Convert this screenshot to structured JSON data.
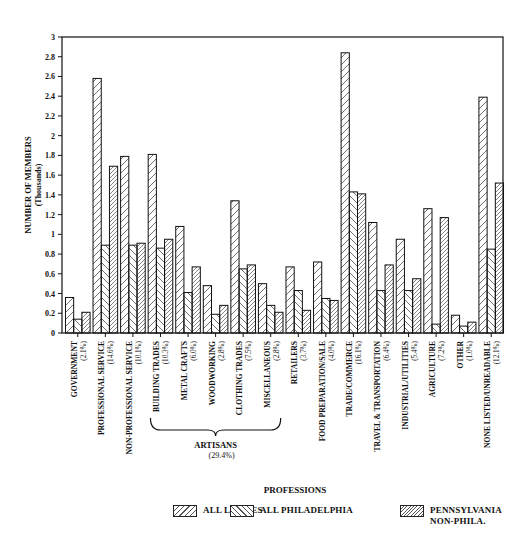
{
  "chart_data": {
    "type": "bar",
    "title": "",
    "xlabel": "PROFESSIONS",
    "ylabel": "NUMBER OF MEMBERS",
    "ylabel_sub": "(Thousands)",
    "ylim": [
      0,
      3
    ],
    "yticks": [
      "0",
      "0.2",
      "0.4",
      "0.6",
      "0.8",
      "1",
      "1.2",
      "1.4",
      "1.6",
      "1.8",
      "2",
      "2.2",
      "2.4",
      "2.6",
      "2.8",
      "3"
    ],
    "grid": false,
    "legend_position": "bottom",
    "categories": [
      {
        "name": "GOVERNMENT",
        "pct": "(2.1%)"
      },
      {
        "name": "PROFESSIONAL SERVICE",
        "pct": "(14.6%)"
      },
      {
        "name": "NON-PROFESSIONAL SERVICE",
        "pct": "(10.1%)"
      },
      {
        "name": "BUILDING TRADES",
        "pct": "(10.3%)"
      },
      {
        "name": "METAL CRAFTS",
        "pct": "(6.0%)"
      },
      {
        "name": "WOODWORKING",
        "pct": "(2.8%)"
      },
      {
        "name": "CLOTHING TRADES",
        "pct": "(7.5%)"
      },
      {
        "name": "MISCELLANEOUS",
        "pct": "(2.8%)"
      },
      {
        "name": "RETAILERS",
        "pct": "(3.7%)"
      },
      {
        "name": "FOOD PREPARATION/SALE",
        "pct": "(4.0%)"
      },
      {
        "name": "TRADE/COMMERCE",
        "pct": "(16.1%)"
      },
      {
        "name": "TRAVEL & TRANSPORTATION",
        "pct": "(6.4%)"
      },
      {
        "name": "INDUSTRIAL/UTILITIES",
        "pct": "(5.4%)"
      },
      {
        "name": "AGRICULTURE",
        "pct": "(7.2%)"
      },
      {
        "name": "OTHER",
        "pct": "(1.0%)"
      },
      {
        "name": "NONE LISTED/UNREADABLE",
        "pct": "(12.1%)"
      }
    ],
    "group_annotation": {
      "label": "ARTISANS",
      "pct": "(29.4%)",
      "from": 3,
      "to": 7
    },
    "series": [
      {
        "name": "ALL LODGES",
        "pattern": "forward-hatch",
        "values": [
          0.36,
          2.58,
          1.79,
          1.81,
          1.08,
          0.48,
          1.34,
          0.5,
          0.67,
          0.72,
          2.84,
          1.12,
          0.95,
          1.26,
          0.18,
          2.39
        ]
      },
      {
        "name": "ALL PHILADELPHIA",
        "pattern": "back-hatch",
        "values": [
          0.14,
          0.89,
          0.89,
          0.86,
          0.41,
          0.19,
          0.65,
          0.28,
          0.43,
          0.35,
          1.43,
          0.43,
          0.43,
          0.09,
          0.07,
          0.85
        ]
      },
      {
        "name": "PENNSYLVANIA NON-PHILA.",
        "pattern": "dense-forward-hatch",
        "values": [
          0.21,
          1.69,
          0.91,
          0.95,
          0.67,
          0.28,
          0.69,
          0.21,
          0.23,
          0.33,
          1.41,
          0.69,
          0.55,
          1.17,
          0.11,
          1.52
        ]
      }
    ]
  },
  "legend": {
    "items": [
      {
        "label": "ALL LODGES"
      },
      {
        "label": "ALL PHILADELPHIA"
      },
      {
        "label": "PENNSYLVANIA\nNON-PHILA."
      }
    ]
  },
  "colors": {
    "ink": "#111111",
    "background": "#ffffff"
  }
}
